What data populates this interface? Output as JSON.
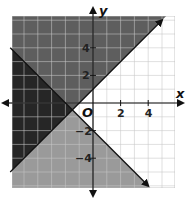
{
  "chart_data": {
    "type": "area",
    "title": "",
    "xlabel": "x",
    "ylabel": "y",
    "origin_label": "O",
    "xlim": [
      -6,
      6
    ],
    "ylim": [
      -6,
      6
    ],
    "grid": true,
    "x_ticks": [
      {
        "value": 2,
        "label": "2"
      },
      {
        "value": 4,
        "label": "4"
      }
    ],
    "y_ticks": [
      {
        "value": 4,
        "label": "4"
      },
      {
        "value": 2,
        "label": "2"
      },
      {
        "value": -2,
        "label": "−2"
      },
      {
        "value": -4,
        "label": "−4"
      }
    ],
    "boundary_lines": [
      {
        "name": "line-1",
        "equation": "y = x + 1",
        "slope": 1,
        "intercept": 1,
        "style": "solid",
        "shading": "above"
      },
      {
        "name": "line-2",
        "equation": "y = -x - 2",
        "slope": -1,
        "intercept": -2,
        "style": "solid",
        "shading": "below"
      }
    ],
    "regions": [
      {
        "name": "above-line-1",
        "inequality": "y ≥ x + 1",
        "color": "#5e5e5e"
      },
      {
        "name": "below-line-2",
        "inequality": "y ≤ -x - 2",
        "color": "#9a9a9a"
      },
      {
        "name": "overlap",
        "inequality": "y ≥ x + 1 and y ≤ -x - 2",
        "color": "#262626"
      }
    ],
    "intersection": {
      "x": -1.5,
      "y": -0.5
    }
  },
  "colors": {
    "grid": "#c8c8c8",
    "axis": "#111111",
    "background": "#ffffff"
  }
}
